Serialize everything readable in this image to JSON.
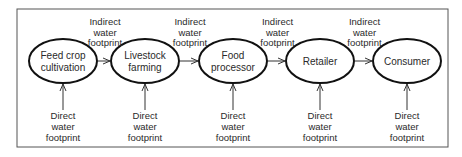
{
  "diagram": {
    "nodes": [
      {
        "id": "feed",
        "lines": [
          "Feed crop",
          "cultivation"
        ]
      },
      {
        "id": "livestock",
        "lines": [
          "Livestock",
          "farming"
        ]
      },
      {
        "id": "processor",
        "lines": [
          "Food",
          "processor"
        ]
      },
      {
        "id": "retailer",
        "lines": [
          "Retailer"
        ]
      },
      {
        "id": "consumer",
        "lines": [
          "Consumer"
        ]
      }
    ],
    "indirect_label": [
      "Indirect",
      "water",
      "footprint"
    ],
    "direct_label": [
      "Direct",
      "water",
      "footprint"
    ],
    "edges": [
      {
        "from": "feed",
        "to": "livestock",
        "label": "Indirect water footprint"
      },
      {
        "from": "livestock",
        "to": "processor",
        "label": "Indirect water footprint"
      },
      {
        "from": "processor",
        "to": "retailer",
        "label": "Indirect water footprint"
      },
      {
        "from": "retailer",
        "to": "consumer",
        "label": "Indirect water footprint"
      }
    ]
  }
}
